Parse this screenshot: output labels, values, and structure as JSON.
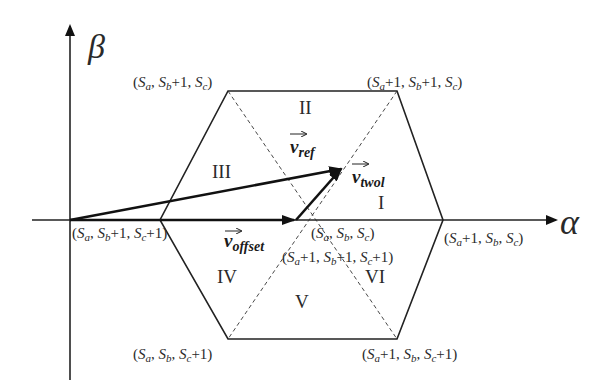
{
  "axes": {
    "beta_label": "β",
    "alpha_label": "α"
  },
  "sectors": {
    "I": "I",
    "II": "II",
    "III": "III",
    "IV": "IV",
    "V": "V",
    "VI": "VI"
  },
  "vertices": {
    "top_left": {
      "base": "(S",
      "a": "a",
      "sep1": ", S",
      "b": "b",
      "mid": "+1, S",
      "c": "c",
      "end": ")"
    },
    "top_right": {
      "text": "(Sa+1, Sb+1, Sc)"
    },
    "right": {
      "text": "(Sa+1, Sb, Sc)"
    },
    "bottom_right": {
      "text": "(Sa+1, Sb, Sc+1)"
    },
    "bottom_left": {
      "text": "(Sa, Sb, Sc+1)"
    },
    "left": {
      "text": "(Sa, Sb+1, Sc+1)"
    },
    "center_upper": {
      "text": "(Sa, Sb, Sc)"
    },
    "center_lower": {
      "text": "(Sa+1, Sb+1, Sc+1)"
    }
  },
  "vectors": {
    "vref": {
      "main": "v",
      "sub": "ref"
    },
    "vtwol": {
      "main": "v",
      "sub": "twol"
    },
    "voffset": {
      "main": "v",
      "sub": "offset"
    }
  },
  "colors": {
    "line": "#222222",
    "text": "#2a2a2a",
    "background": "#ffffff"
  }
}
